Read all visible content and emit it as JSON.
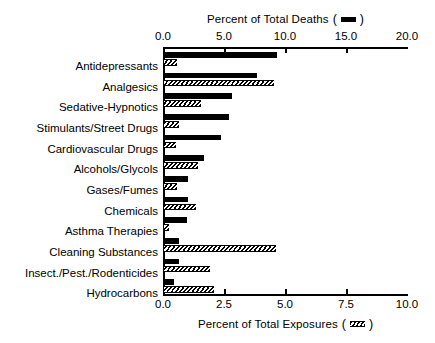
{
  "chart_data": {
    "type": "bar",
    "orientation": "horizontal",
    "title": "",
    "categories": [
      "Antidepressants",
      "Analgesics",
      "Sedative-Hypnotics",
      "Stimulants/Street Drugs",
      "Cardiovascular Drugs",
      "Alcohols/Glycols",
      "Gases/Fumes",
      "Chemicals",
      "Asthma Therapies",
      "Cleaning Substances",
      "Insect./Pest./Rodenticides",
      "Hydrocarbons"
    ],
    "series": [
      {
        "name": "Percent of Total Deaths",
        "axis": "top",
        "style": "solid-black",
        "values": [
          9.3,
          7.6,
          5.6,
          5.3,
          4.7,
          3.3,
          2.0,
          1.95,
          1.85,
          1.2,
          1.2,
          0.8
        ]
      },
      {
        "name": "Percent of Total Exposures",
        "axis": "bottom",
        "style": "hatched",
        "values": [
          0.55,
          4.5,
          1.5,
          0.6,
          0.5,
          1.4,
          0.55,
          1.3,
          0.2,
          4.6,
          1.9,
          2.05
        ]
      }
    ],
    "top_axis": {
      "label": "Percent of Total Deaths",
      "ticks": [
        "0.0",
        "5.0",
        "10.0",
        "15.0",
        "20.0"
      ],
      "tick_values": [
        0.0,
        5.0,
        10.0,
        15.0,
        20.0
      ],
      "min": 0.0,
      "max": 20.0
    },
    "bottom_axis": {
      "label": "Percent of Total Exposures",
      "ticks": [
        "0.0",
        "2.5",
        "5.0",
        "7.5",
        "10.0"
      ],
      "tick_values": [
        0.0,
        2.5,
        5.0,
        7.5,
        10.0
      ],
      "min": 0.0,
      "max": 10.0
    },
    "grid": false,
    "legend": {
      "position": "in-axis-titles",
      "entries": [
        {
          "label": "Percent of Total Deaths",
          "swatch": "solid-black-bar-icon"
        },
        {
          "label": "Percent of Total Exposures",
          "swatch": "hatched-bar-icon"
        }
      ]
    },
    "colors": {
      "deaths_bar": "#000000",
      "exposures_bar_outline": "#000000",
      "exposures_bar_fill": "#ffffff",
      "background": "#ffffff",
      "text": "#000000"
    }
  }
}
